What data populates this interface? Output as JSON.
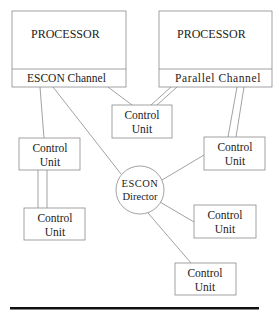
{
  "diagram": {
    "colors": {
      "line": "#8a8a8a",
      "text": "#222222",
      "rule": "#111111",
      "background": "#ffffff"
    },
    "processors": [
      {
        "label": "PROCESSOR",
        "channel": "ESCON Channel"
      },
      {
        "label": "PROCESSOR",
        "channel": "Parallel Channel"
      }
    ],
    "director": {
      "line1": "ESCON",
      "line2": "Director"
    },
    "control_units": [
      {
        "id": "cu-top-center",
        "line1": "Control",
        "line2": "Unit"
      },
      {
        "id": "cu-left",
        "line1": "Control",
        "line2": "Unit"
      },
      {
        "id": "cu-lower-left",
        "line1": "Control",
        "line2": "Unit"
      },
      {
        "id": "cu-right",
        "line1": "Control",
        "line2": "Unit"
      },
      {
        "id": "cu-mid-right",
        "line1": "Control",
        "line2": "Unit"
      },
      {
        "id": "cu-bottom",
        "line1": "Control",
        "line2": "Unit"
      }
    ]
  }
}
